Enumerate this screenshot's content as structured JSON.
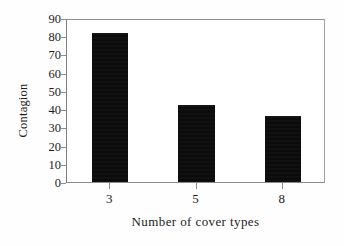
{
  "chart_data": {
    "type": "bar",
    "title": "",
    "subtitle": "",
    "xlabel": "Number of cover types",
    "ylabel": "Contagion",
    "categories": [
      "3",
      "5",
      "8"
    ],
    "values": [
      82,
      42,
      36
    ],
    "series": [
      {
        "name": "Contagion",
        "values": [
          82,
          42,
          36
        ]
      }
    ],
    "ylim": [
      0,
      90
    ],
    "xlim": [
      0,
      3
    ],
    "ytick_labels": [
      "0",
      "10",
      "20",
      "30",
      "40",
      "50",
      "60",
      "70",
      "80",
      "90"
    ],
    "ytick_values": [
      0,
      10,
      20,
      30,
      40,
      50,
      60,
      70,
      80,
      90
    ],
    "xtick_labels": [
      "3",
      "5",
      "8"
    ],
    "grid": false,
    "legend": false,
    "legend_position": "none",
    "annotations": [],
    "bar_color": "#0b0b0b",
    "axis_color": "#8d8d8d",
    "background_color": "#ffffff",
    "frame": true,
    "bar_width_fraction": 0.42
  }
}
